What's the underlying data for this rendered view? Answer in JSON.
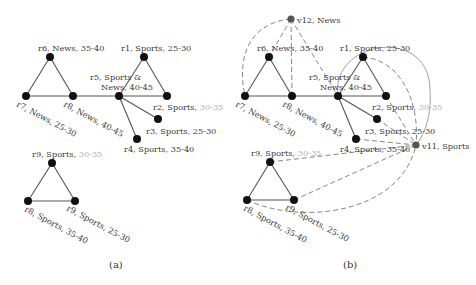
{
  "panels": [
    {
      "caption": "(a)",
      "nodes": {
        "r6": {
          "name": "r6, News,",
          "age": " 35-40"
        },
        "r7": {
          "name": "r7, News,",
          "age": " 25-30"
        },
        "r8": {
          "name": "r8, News,",
          "age": " 40-45"
        },
        "r5a": {
          "name": "r5, Sports &"
        },
        "r5b": {
          "name": "News,",
          "age": " 40-45"
        },
        "r1": {
          "name": "r1, Sports,",
          "age": " 25-30"
        },
        "r2": {
          "name": "r2, Sports,",
          "age": " 30-35"
        },
        "r3": {
          "name": "r3, Sports,",
          "age": " 25-30"
        },
        "r4": {
          "name": "r4, Sports,",
          "age": " 35-40"
        },
        "r9top": {
          "name": "r9, Sports,",
          "age": " 30-35"
        },
        "r8bl": {
          "name": "r8, Sports,",
          "age": " 35-40"
        },
        "r9br": {
          "name": "r9, Sports,",
          "age": " 25-30"
        }
      }
    },
    {
      "caption": "(b)",
      "nodes": {
        "v12": {
          "name": "v12, News"
        },
        "v11": {
          "name": "v11, Sports"
        },
        "r6": {
          "name": "r6, News,",
          "age": " 35-40"
        },
        "r7": {
          "name": "r7, News,",
          "age": " 25-30"
        },
        "r8": {
          "name": "r8, News,",
          "age": " 40-45"
        },
        "r5a": {
          "name": "r5, Sports &"
        },
        "r5b": {
          "name": "News,",
          "age": " 40-45"
        },
        "r1": {
          "name": "r1, Sports,",
          "age": " 25-30"
        },
        "r2": {
          "name": "r2, Sports,",
          "age": " 30-35"
        },
        "r3": {
          "name": "r3, Sports,",
          "age": " 25-30"
        },
        "r4": {
          "name": "r4, Sports,",
          "age": " 35-40"
        },
        "r9top": {
          "name": "r9, Sports,",
          "age": " 30-35"
        },
        "r8bl": {
          "name": "r8, Sports,",
          "age": " 35-40"
        },
        "r9br": {
          "name": "r9, Sports,",
          "age": " 25-30"
        }
      }
    }
  ]
}
